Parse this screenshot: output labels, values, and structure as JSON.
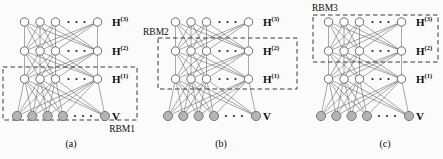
{
  "figure": {
    "panels": [
      {
        "caption": "(a)",
        "rbm_label": "RBM1",
        "rbm_encloses": [
          "V",
          "H(1)"
        ]
      },
      {
        "caption": "(b)",
        "rbm_label": "RBM2",
        "rbm_encloses": [
          "H(1)",
          "H(2)"
        ]
      },
      {
        "caption": "(c)",
        "rbm_label": "RBM3",
        "rbm_encloses": [
          "H(2)",
          "H(3)"
        ]
      }
    ],
    "layer_labels": [
      {
        "id": "H3",
        "base": "H",
        "sup": "(3)"
      },
      {
        "id": "H2",
        "base": "H",
        "sup": "(2)"
      },
      {
        "id": "H1",
        "base": "H",
        "sup": "(1)"
      },
      {
        "id": "V",
        "base": "V",
        "sup": ""
      }
    ],
    "layers_per_panel": 4,
    "shown_hidden_nodes_per_layer": 4,
    "shown_visible_nodes": 5,
    "ellipsis": "· · ·",
    "colors": {
      "background": "#fbfbfb",
      "edge": "#4f4f4f",
      "hidden_node_fill": "#fdfdfd",
      "hidden_node_stroke": "#5f5f5f",
      "visible_node_fill": "#b4b4b4",
      "visible_node_stroke": "#6e6e6e",
      "dashed_box": "#3a3a3a",
      "text": "#0d0d0d"
    }
  }
}
